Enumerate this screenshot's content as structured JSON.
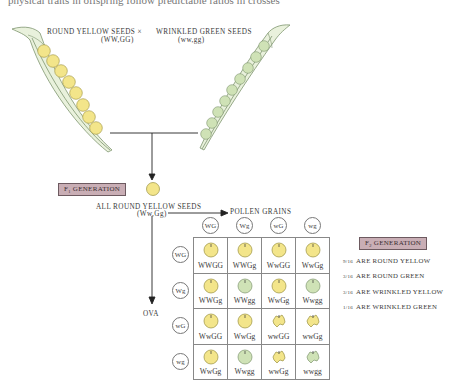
{
  "clipped_text": "physical traits in offspring follow predictable ratios in crosses",
  "parents": {
    "left": {
      "label": "ROUND YELLOW SEEDS",
      "genotype": "(WW,GG)",
      "seed_color": "#f3e58a",
      "seed_count": 8
    },
    "cross_symbol": "×",
    "right": {
      "label": "WRINKLED GREEN SEEDS",
      "genotype": "(ww,gg)",
      "seed_color": "#cfe2b6",
      "seed_count": 9
    }
  },
  "f1": {
    "badge": "F1 GENERATION",
    "badge_main": "F",
    "badge_sub": "1",
    "badge_rest": " GENERATION",
    "description": "ALL ROUND YELLOW SEEDS",
    "genotype": "(Ww,Gg)"
  },
  "arrows": {
    "pollen_label": "POLLEN GRAINS",
    "ova_label": "OVA"
  },
  "punnett": {
    "pollen": [
      "WG",
      "Wg",
      "wG",
      "wg"
    ],
    "ova": [
      "WG",
      "Wg",
      "wG",
      "wg"
    ],
    "rows": [
      [
        {
          "g": "WWGG",
          "shape": "round",
          "color": "yellow"
        },
        {
          "g": "WWGg",
          "shape": "round",
          "color": "yellow"
        },
        {
          "g": "WwGG",
          "shape": "round",
          "color": "yellow"
        },
        {
          "g": "WwGg",
          "shape": "round",
          "color": "yellow"
        }
      ],
      [
        {
          "g": "WWGg",
          "shape": "round",
          "color": "yellow"
        },
        {
          "g": "WWgg",
          "shape": "round",
          "color": "green"
        },
        {
          "g": "WwGg",
          "shape": "round",
          "color": "yellow"
        },
        {
          "g": "Wwgg",
          "shape": "round",
          "color": "green"
        }
      ],
      [
        {
          "g": "WwGG",
          "shape": "round",
          "color": "yellow"
        },
        {
          "g": "WwGg",
          "shape": "round",
          "color": "yellow"
        },
        {
          "g": "wwGG",
          "shape": "wrinkled",
          "color": "yellow"
        },
        {
          "g": "wwGg",
          "shape": "wrinkled",
          "color": "yellow"
        }
      ],
      [
        {
          "g": "WwGg",
          "shape": "round",
          "color": "yellow"
        },
        {
          "g": "Wwgg",
          "shape": "round",
          "color": "green"
        },
        {
          "g": "wwGg",
          "shape": "wrinkled",
          "color": "yellow"
        },
        {
          "g": "wwgg",
          "shape": "wrinkled",
          "color": "green"
        }
      ]
    ]
  },
  "f2": {
    "badge_main": "F",
    "badge_sub": "2",
    "badge_rest": " GENERATION",
    "ratios": [
      {
        "fraction": "9/16",
        "text": "ARE ROUND YELLOW"
      },
      {
        "fraction": "3/16",
        "text": "ARE ROUND GREEN"
      },
      {
        "fraction": "3/16",
        "text": "ARE WRINKLED YELLOW"
      },
      {
        "fraction": "1/16",
        "text": "ARE WRINKLED GREEN"
      }
    ]
  },
  "colors": {
    "yellow_seed": "#f3e58a",
    "green_seed": "#cfe2b6",
    "pod_fill": "#e9f1dc",
    "pod_stroke": "#7f9670",
    "badge_bg": "#c9aeb5",
    "grid_line": "#888888"
  }
}
